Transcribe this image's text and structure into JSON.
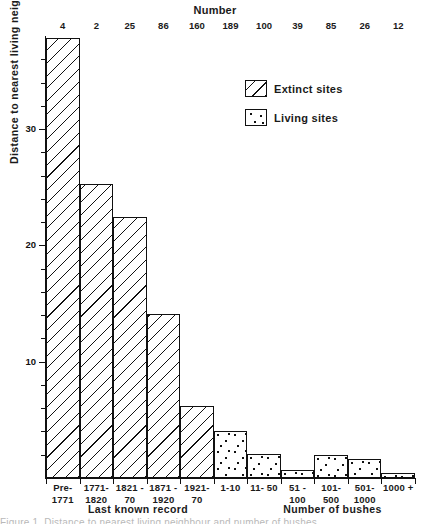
{
  "top_axis": {
    "title": "Number",
    "values": [
      4,
      2,
      25,
      86,
      160,
      189,
      100,
      39,
      85,
      26,
      12
    ]
  },
  "yaxis": {
    "title": "Distance to nearest living neighbour (km)",
    "ticks": [
      10,
      20,
      30
    ],
    "tick_labels": [
      "10",
      "20",
      "30"
    ]
  },
  "xaxis": {
    "left_title": "Last known record",
    "right_title": "Number of bushes",
    "labels": [
      {
        "line1": "Pre-",
        "line2": "1771"
      },
      {
        "line1": "1771-",
        "line2": "1820"
      },
      {
        "line1": "1821 -",
        "line2": "70"
      },
      {
        "line1": "1871 -",
        "line2": "1920"
      },
      {
        "line1": "1921-",
        "line2": "70"
      },
      {
        "line1": "1-10",
        "line2": ""
      },
      {
        "line1": "11- 50",
        "line2": ""
      },
      {
        "line1": "51 -",
        "line2": "100"
      },
      {
        "line1": "101-",
        "line2": "500"
      },
      {
        "line1": "501-",
        "line2": "1000"
      },
      {
        "line1": "1000 +",
        "line2": ""
      }
    ]
  },
  "legend": {
    "items": [
      {
        "label": "Extinct sites",
        "pattern": "hatched"
      },
      {
        "label": "Living sites",
        "pattern": "dotted"
      }
    ]
  },
  "caption": "Figure 1.  Distance to nearest living neighbour and number of bushes",
  "colors": {
    "ink": "#111111",
    "background": "#ffffff"
  },
  "chart_data": {
    "type": "bar",
    "title": "",
    "xlabel": "Last known record / Number of bushes",
    "ylabel": "Distance to nearest living neighbour (km)",
    "ylim": [
      0,
      38
    ],
    "grid": false,
    "legend_position": "upper-right",
    "categories": [
      "Pre-1771",
      "1771-1820",
      "1821-70",
      "1871-1920",
      "1921-70",
      "1-10",
      "11-50",
      "51-100",
      "101-500",
      "501-1000",
      "1000 +"
    ],
    "series": [
      {
        "name": "Extinct sites",
        "pattern": "hatched",
        "values": [
          37.8,
          25.3,
          22.4,
          14.1,
          6.2,
          null,
          null,
          null,
          null,
          null,
          null
        ]
      },
      {
        "name": "Living sites",
        "pattern": "dotted",
        "values": [
          null,
          null,
          null,
          null,
          null,
          4.0,
          2.1,
          0.7,
          2.0,
          1.6,
          0.4
        ]
      }
    ],
    "top_axis_label": "Number",
    "top_axis_values": [
      4,
      2,
      25,
      86,
      160,
      189,
      100,
      39,
      85,
      26,
      12
    ],
    "yticks": [
      10,
      20,
      30
    ]
  }
}
